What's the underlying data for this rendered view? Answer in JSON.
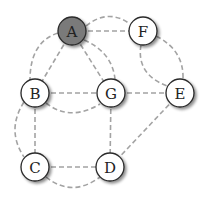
{
  "diagram": {
    "type": "undirected-multigraph",
    "colors": {
      "highlight_fill": "#7a7a7a",
      "node_fill": "#ffffff",
      "edge_color": "#a3a3a3"
    },
    "nodes": [
      {
        "id": "A",
        "label": "A",
        "highlighted": true
      },
      {
        "id": "F",
        "label": "F",
        "highlighted": false
      },
      {
        "id": "B",
        "label": "B",
        "highlighted": false
      },
      {
        "id": "G",
        "label": "G",
        "highlighted": false
      },
      {
        "id": "E",
        "label": "E",
        "highlighted": false
      },
      {
        "id": "C",
        "label": "C",
        "highlighted": false
      },
      {
        "id": "D",
        "label": "D",
        "highlighted": false
      }
    ],
    "edges": [
      {
        "from": "A",
        "to": "F",
        "style": "straight"
      },
      {
        "from": "A",
        "to": "F",
        "style": "curved"
      },
      {
        "from": "A",
        "to": "B",
        "style": "straight"
      },
      {
        "from": "A",
        "to": "B",
        "style": "curved"
      },
      {
        "from": "A",
        "to": "G",
        "style": "straight"
      },
      {
        "from": "A",
        "to": "G",
        "style": "curved"
      },
      {
        "from": "F",
        "to": "E",
        "style": "curved-inner"
      },
      {
        "from": "F",
        "to": "E",
        "style": "curved-outer"
      },
      {
        "from": "B",
        "to": "G",
        "style": "straight"
      },
      {
        "from": "B",
        "to": "G",
        "style": "curved"
      },
      {
        "from": "G",
        "to": "E",
        "style": "straight"
      },
      {
        "from": "B",
        "to": "C",
        "style": "straight"
      },
      {
        "from": "B",
        "to": "C",
        "style": "curved"
      },
      {
        "from": "G",
        "to": "D",
        "style": "straight"
      },
      {
        "from": "E",
        "to": "D",
        "style": "straight"
      },
      {
        "from": "C",
        "to": "D",
        "style": "straight"
      },
      {
        "from": "C",
        "to": "D",
        "style": "curved"
      }
    ]
  }
}
